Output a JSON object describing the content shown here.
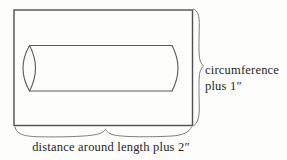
{
  "diagram": {
    "colors": {
      "background": "#fdfdfb",
      "outline": "#4e4e4e",
      "cylinder": "#5a5a5a",
      "brace": "#6f6f6f",
      "text": "#262626"
    },
    "labels": {
      "right_brace_line1": "circumference",
      "right_brace_line2": "plus 1″",
      "bottom_brace": "distance around length plus 2″"
    }
  }
}
